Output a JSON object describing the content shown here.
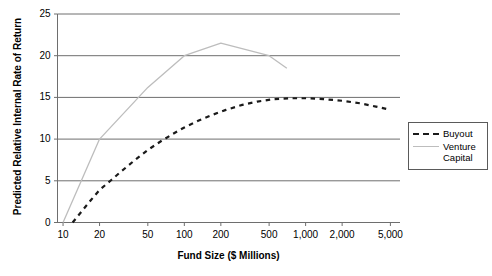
{
  "chart_data": {
    "type": "line",
    "title": "",
    "xlabel": "Fund Size ($ Millions)",
    "ylabel": "Predicted Relative Internal Rate of Return",
    "xscale": "log",
    "xlim": [
      9,
      6000
    ],
    "ylim": [
      0,
      25
    ],
    "x_ticks": [
      10,
      20,
      50,
      100,
      200,
      500,
      1000,
      2000,
      5000
    ],
    "x_tick_labels": [
      "10",
      "20",
      "50",
      "100",
      "200",
      "500",
      "1,000",
      "2,000",
      "5,000"
    ],
    "y_ticks": [
      0,
      5,
      10,
      15,
      20,
      25
    ],
    "y_tick_labels": [
      "0",
      "5",
      "10",
      "15",
      "20",
      "25"
    ],
    "grid": "horizontal",
    "legend_position": "right",
    "series": [
      {
        "name": "Buyout",
        "style": "dashed",
        "color": "#1a1a1a",
        "x": [
          12,
          14,
          17,
          20,
          25,
          30,
          40,
          50,
          65,
          80,
          100,
          130,
          170,
          220,
          300,
          400,
          550,
          750,
          1000,
          1400,
          2000,
          2800,
          3800,
          5000
        ],
        "y": [
          0.0,
          1.2,
          2.7,
          3.9,
          5.1,
          6.1,
          7.6,
          8.7,
          9.8,
          10.6,
          11.4,
          12.2,
          12.9,
          13.5,
          14.1,
          14.5,
          14.8,
          14.9,
          14.9,
          14.8,
          14.6,
          14.3,
          13.9,
          13.5
        ]
      },
      {
        "name": "Venture Capital",
        "style": "solid",
        "color": "#bdbdbd",
        "x": [
          10,
          20,
          50,
          100,
          200,
          500,
          700
        ],
        "y": [
          0.0,
          10.0,
          16.2,
          20.0,
          21.5,
          20.0,
          18.5
        ]
      }
    ]
  },
  "legend": {
    "items": [
      {
        "label": "Buyout"
      },
      {
        "label": "Venture\nCapital"
      }
    ]
  }
}
